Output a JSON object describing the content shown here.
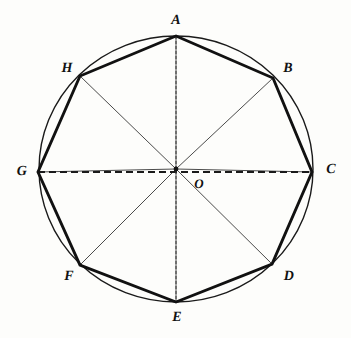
{
  "figure": {
    "kind": "geometric-diagram",
    "background_color": "#fdfdfb",
    "ink_color": "#111111",
    "canvas": {
      "width": 351,
      "height": 338
    }
  },
  "circle": {
    "name": "circumscribed-circle",
    "center": {
      "x": 176,
      "y": 169
    },
    "radius_x": 137,
    "radius_y": 133,
    "stroke_width": 1.4,
    "color": "#1a1a1a"
  },
  "center_point": {
    "label": "O",
    "x": 176,
    "y": 169,
    "label_x": 199,
    "label_y": 183,
    "dot_radius": 2.4,
    "font_size": 13
  },
  "vertices": [
    {
      "label": "A",
      "x": 176,
      "y": 36,
      "label_x": 176,
      "label_y": 21,
      "font_size": 14
    },
    {
      "label": "B",
      "x": 273,
      "y": 78,
      "label_x": 288,
      "label_y": 69,
      "font_size": 14
    },
    {
      "label": "C",
      "x": 312,
      "y": 172,
      "label_x": 331,
      "label_y": 170,
      "font_size": 14
    },
    {
      "label": "D",
      "x": 272,
      "y": 264,
      "label_x": 289,
      "label_y": 277,
      "font_size": 14
    },
    {
      "label": "E",
      "x": 176,
      "y": 302,
      "label_x": 177,
      "label_y": 318,
      "font_size": 14
    },
    {
      "label": "F",
      "x": 80,
      "y": 265,
      "label_x": 69,
      "label_y": 277,
      "font_size": 14
    },
    {
      "label": "G",
      "x": 38,
      "y": 172,
      "label_x": 22,
      "label_y": 172,
      "font_size": 14
    },
    {
      "label": "H",
      "x": 80,
      "y": 76,
      "label_x": 67,
      "label_y": 69,
      "font_size": 14
    }
  ],
  "polygon": {
    "name": "octagon-ABCDEFGH",
    "sides": 8,
    "stroke_width": 2.9,
    "color": "#111111",
    "edges": [
      "AB",
      "BC",
      "CD",
      "DE",
      "EF",
      "FG",
      "GH",
      "HA"
    ]
  },
  "radii": {
    "name": "center-to-vertex-radii",
    "stroke_width": 0.85,
    "color": "#2a2a2a",
    "segments": [
      "OA",
      "OB",
      "OC",
      "OD",
      "OE",
      "OF",
      "OG",
      "OH"
    ]
  },
  "diameters": [
    {
      "name": "horizontal-diameter-GC",
      "from": "G",
      "to": "C",
      "style": "dashed",
      "dash_pattern": "7 4",
      "stroke_width": 1.8,
      "color": "#1a1a1a"
    },
    {
      "name": "vertical-diameter-AE",
      "from": "A",
      "to": "E",
      "style": "dashed",
      "dash_pattern": "3 2",
      "stroke_width": 1.0,
      "color": "#3a3a3a"
    }
  ]
}
